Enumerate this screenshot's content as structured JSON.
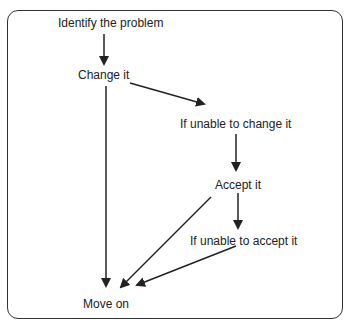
{
  "diagram": {
    "type": "flowchart",
    "nodes": {
      "identify": "Identify the problem",
      "change": "Change it",
      "unable_change": "If unable to change it",
      "accept": "Accept it",
      "unable_accept": "If unable to accept it",
      "move_on": "Move on"
    },
    "edges": [
      {
        "from": "Identify the problem",
        "to": "Change it"
      },
      {
        "from": "Change it",
        "to": "If unable to change it"
      },
      {
        "from": "Change it",
        "to": "Move on"
      },
      {
        "from": "If unable to change it",
        "to": "Accept it"
      },
      {
        "from": "Accept it",
        "to": "If unable to accept it"
      },
      {
        "from": "Accept it",
        "to": "Move on"
      },
      {
        "from": "If unable to accept it",
        "to": "Move on"
      }
    ],
    "colors": {
      "line": "#222222",
      "border": "#333333",
      "background": "#ffffff"
    }
  }
}
